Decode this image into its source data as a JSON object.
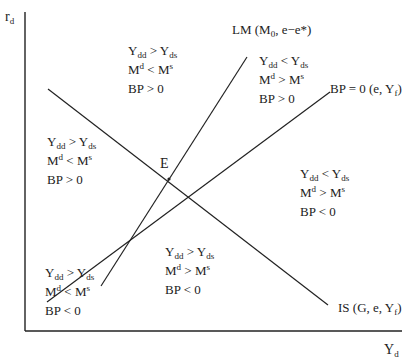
{
  "axes": {
    "y_label": {
      "main": "r",
      "sub": "d"
    },
    "x_label": {
      "main": "Y",
      "sub": "d"
    }
  },
  "curves": {
    "lm": {
      "text": "LM (M",
      "sub": "0",
      "rest": ", e−e*)"
    },
    "bp": {
      "text": "BP = 0 (e, Y",
      "sub": "f",
      "rest": ")"
    },
    "is": {
      "text": "IS (G, e, Y",
      "sub": "f",
      "rest": ")"
    }
  },
  "equilibrium": {
    "label": "E"
  },
  "regions": [
    {
      "goods": {
        "a": "Y",
        "a_sub": "dd",
        "op": " > ",
        "b": "Y",
        "b_sub": "ds"
      },
      "money": {
        "a": "M",
        "a_sup": "d",
        "op": " < ",
        "b": "M",
        "b_sup": "s"
      },
      "bp": "BP > 0"
    },
    {
      "goods": {
        "a": "Y",
        "a_sub": "dd",
        "op": " < ",
        "b": "Y",
        "b_sub": "ds"
      },
      "money": {
        "a": "M",
        "a_sup": "d",
        "op": " > ",
        "b": "M",
        "b_sup": "s"
      },
      "bp": "BP > 0"
    },
    {
      "goods": {
        "a": "Y",
        "a_sub": "dd",
        "op": " > ",
        "b": "Y",
        "b_sub": "ds"
      },
      "money": {
        "a": "M",
        "a_sup": "d",
        "op": " < ",
        "b": "M",
        "b_sup": "s"
      },
      "bp": "BP > 0"
    },
    {
      "goods": {
        "a": "Y",
        "a_sub": "dd",
        "op": " < ",
        "b": "Y",
        "b_sub": "ds"
      },
      "money": {
        "a": "M",
        "a_sup": "d",
        "op": " > ",
        "b": "M",
        "b_sup": "s"
      },
      "bp": "BP < 0"
    },
    {
      "goods": {
        "a": "Y",
        "a_sub": "dd",
        "op": " > ",
        "b": "Y",
        "b_sub": "ds"
      },
      "money": {
        "a": "M",
        "a_sup": "d",
        "op": " > ",
        "b": "M",
        "b_sup": "s"
      },
      "bp": "BP < 0"
    },
    {
      "goods": {
        "a": "Y",
        "a_sub": "dd",
        "op": " > ",
        "b": "Y",
        "b_sub": "ds"
      },
      "money": {
        "a": "M",
        "a_sup": "d",
        "op": " < ",
        "b": "M",
        "b_sup": "s"
      },
      "bp": "BP < 0"
    }
  ]
}
